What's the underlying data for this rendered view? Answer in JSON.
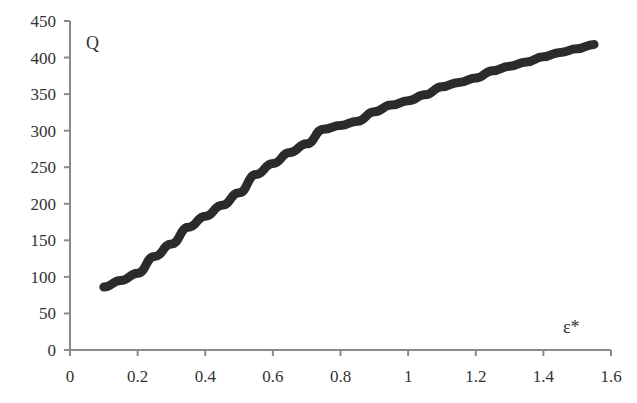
{
  "chart_data": {
    "type": "line",
    "title": "",
    "xlabel": "ε*",
    "ylabel": "Q",
    "xlim": [
      0,
      1.6
    ],
    "ylim": [
      0,
      450
    ],
    "grid": false,
    "legend": null,
    "x_ticks": [
      "0",
      "0.2",
      "0.4",
      "0.6",
      "0.8",
      "1",
      "1.2",
      "1.4",
      "1.6"
    ],
    "y_ticks": [
      "0",
      "50",
      "100",
      "150",
      "200",
      "250",
      "300",
      "350",
      "400",
      "450"
    ],
    "series": [
      {
        "name": "Q",
        "color": "#2b2b2b",
        "x": [
          0.1,
          0.15,
          0.2,
          0.25,
          0.3,
          0.35,
          0.4,
          0.45,
          0.5,
          0.55,
          0.6,
          0.65,
          0.7,
          0.75,
          0.8,
          0.85,
          0.9,
          0.95,
          1.0,
          1.05,
          1.1,
          1.15,
          1.2,
          1.25,
          1.3,
          1.35,
          1.4,
          1.45,
          1.5,
          1.55
        ],
        "y": [
          86,
          95,
          105,
          128,
          145,
          168,
          183,
          198,
          215,
          240,
          255,
          270,
          282,
          302,
          307,
          313,
          326,
          335,
          341,
          349,
          360,
          366,
          372,
          382,
          388,
          394,
          401,
          407,
          412,
          418
        ]
      }
    ]
  },
  "labels": {
    "y_axis_title": "Q",
    "x_axis_title": "ε*"
  }
}
